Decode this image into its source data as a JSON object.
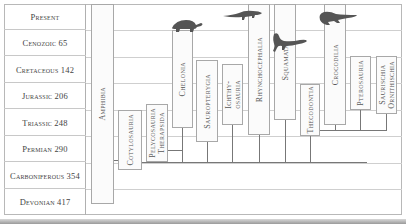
{
  "diagram": {
    "periods": [
      {
        "label": "Present",
        "mya": ""
      },
      {
        "label": "Cenozoic 65",
        "mya": 65
      },
      {
        "label": "Cretaceous 142",
        "mya": 142
      },
      {
        "label": "Jurassic 206",
        "mya": 206
      },
      {
        "label": "Triassic 248",
        "mya": 248
      },
      {
        "label": "Permian 290",
        "mya": 290
      },
      {
        "label": "Carboniferous 354",
        "mya": 354
      },
      {
        "label": "Devonian 417",
        "mya": 417
      }
    ],
    "taxa": [
      {
        "label": "Amphibia",
        "status": "extant"
      },
      {
        "label": "Cotylosauria",
        "status": "extinct"
      },
      {
        "label": "Pelycosauria\nTherapsida",
        "status": "extinct"
      },
      {
        "label": "Chelonia",
        "status": "extant",
        "silhouette": "turtle"
      },
      {
        "label": "Sauropterygia",
        "status": "extinct"
      },
      {
        "label": "Ichthy-\nosauria",
        "status": "extinct"
      },
      {
        "label": "Rhynchocephalia",
        "status": "extant",
        "silhouette": "tuatara"
      },
      {
        "label": "Squamata",
        "status": "extant",
        "silhouette": "lizard"
      },
      {
        "label": "Thecodontia",
        "status": "extinct"
      },
      {
        "label": "Crocodilia",
        "status": "extant",
        "silhouette": "crocodile"
      },
      {
        "label": "Pterosauria",
        "status": "extinct"
      },
      {
        "label": "Saurischia\nOrnithischia",
        "status": "extinct"
      }
    ],
    "colors": {
      "silhouette": "#555555",
      "box_border": "#a8a8a8",
      "line": "#777777",
      "text": "#555555"
    }
  }
}
